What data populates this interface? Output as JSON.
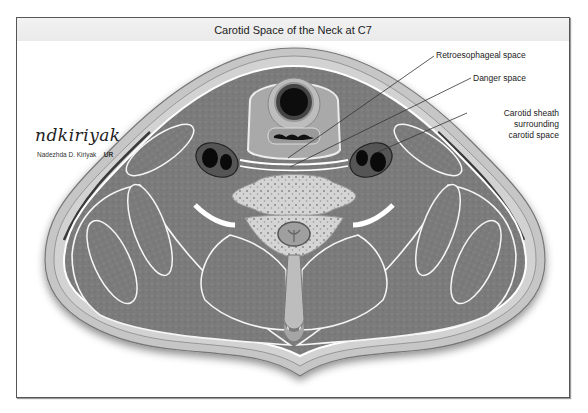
{
  "figure": {
    "title": "Carotid Space of the Neck at C7",
    "signature": {
      "script": "ndkiriyak",
      "name": "Nadezhda D. Kiriyak",
      "logo": "UR"
    },
    "labels": [
      {
        "id": "retroesophageal",
        "text": "Retroesophageal space"
      },
      {
        "id": "danger",
        "text": "Danger space"
      },
      {
        "id": "carotid_line1",
        "text": "Carotid sheath"
      },
      {
        "id": "carotid_line2",
        "text": "surrounding"
      },
      {
        "id": "carotid_line3",
        "text": "carotid space"
      }
    ],
    "colors": {
      "frame_border": "#555555",
      "title_bar": "#eeeeee",
      "muscle": "#7a7a7a",
      "fat": "#ffffff",
      "skin": "#c8c8c8",
      "bone": "#d6d6d6",
      "lumen": "#111111"
    }
  }
}
